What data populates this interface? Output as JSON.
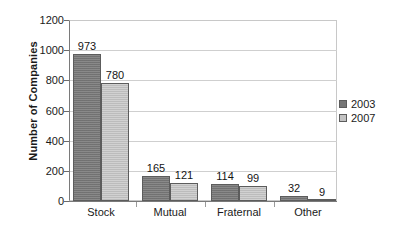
{
  "chart_data": {
    "type": "bar",
    "title": "",
    "xlabel": "",
    "ylabel": "Number of Companies",
    "categories": [
      "Stock",
      "Mutual",
      "Fraternal",
      "Other"
    ],
    "series": [
      {
        "name": "2003",
        "color": "#767676",
        "values": [
          973,
          165,
          114,
          32
        ]
      },
      {
        "name": "2007",
        "color": "#c2c2c2",
        "values": [
          780,
          121,
          99,
          9
        ]
      }
    ],
    "ylim": [
      0,
      1200
    ],
    "y_ticks": [
      0,
      200,
      400,
      600,
      800,
      1000,
      1200
    ],
    "y_tick_labels": [
      "0",
      "200",
      "400",
      "600",
      "800",
      "1000",
      "1200"
    ],
    "grid": true,
    "legend_position": "right",
    "data_labels": [
      [
        "973",
        "780"
      ],
      [
        "165",
        "121"
      ],
      [
        "114",
        "99"
      ],
      [
        "32",
        "9"
      ]
    ]
  },
  "legend": {
    "entries": [
      {
        "label": "2003"
      },
      {
        "label": "2007"
      }
    ]
  }
}
